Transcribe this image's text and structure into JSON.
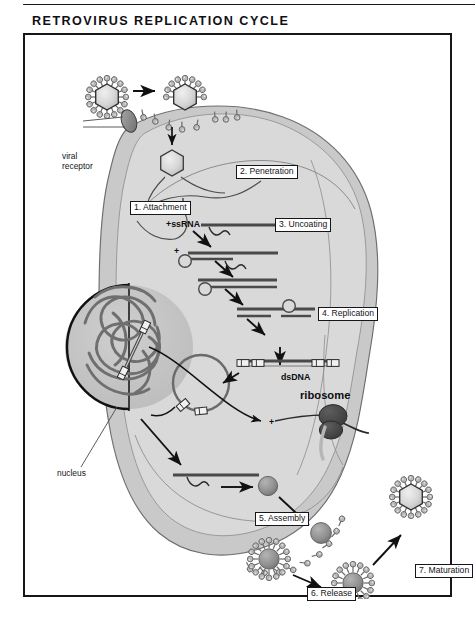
{
  "figure": {
    "title": "RETROVIRUS REPLICATION CYCLE",
    "type": "biological-process-diagram"
  },
  "steps": [
    {
      "id": "attachment",
      "label": "1. Attachment",
      "x": 105,
      "y": 166
    },
    {
      "id": "penetration",
      "label": "2. Penetration",
      "x": 211,
      "y": 130
    },
    {
      "id": "uncoating",
      "label": "3. Uncoating",
      "x": 250,
      "y": 183
    },
    {
      "id": "replication",
      "label": "4. Replication",
      "x": 293,
      "y": 272
    },
    {
      "id": "assembly",
      "label": "5. Assembly",
      "x": 230,
      "y": 477
    },
    {
      "id": "release",
      "label": "6. Release",
      "x": 282,
      "y": 552
    },
    {
      "id": "maturation",
      "label": "7. Maturation",
      "x": 390,
      "y": 529
    }
  ],
  "annotations": [
    {
      "id": "viral-receptor",
      "label": "viral\nreceptor",
      "line1": "viral",
      "line2": "receptor",
      "x": 37,
      "y": 118
    },
    {
      "id": "nucleus",
      "label": "nucleus",
      "x": 32,
      "y": 438
    }
  ],
  "molecules": [
    {
      "id": "plus-ssrna",
      "label": "+ssRNA",
      "x": 141,
      "y": 222,
      "style": "bold"
    },
    {
      "id": "dsdna",
      "label": "dsDNA",
      "x": 256,
      "y": 337,
      "style": "bold"
    },
    {
      "id": "ribosome",
      "label": "ribosome",
      "x": 275,
      "y": 361,
      "style": "bold-big"
    }
  ],
  "plus_signs": [
    {
      "id": "plus-minus-strand",
      "label": "+",
      "x": 149,
      "y": 245
    },
    {
      "id": "plus-mrna",
      "label": "+",
      "x": 248,
      "y": 385
    }
  ],
  "colors": {
    "page_background": "#ffffff",
    "frame_border": "#15151a",
    "cytoplasm_outer": "#c9c9c9",
    "cytoplasm_inner": "#d9d9d9",
    "nucleus_fill": "#c2c2c2",
    "nucleus_envelope": "#111111",
    "chromatin": "#6f6f6f",
    "virus_capsid": "#d2d2d2",
    "spike": "#9a9a9a",
    "ribosome": "#4a4a4a",
    "capsid_protein_ball": "#8e8e8e",
    "nucleic_acid_line": "#4a4a4a",
    "arrow": "#111111",
    "text": "#141418"
  }
}
